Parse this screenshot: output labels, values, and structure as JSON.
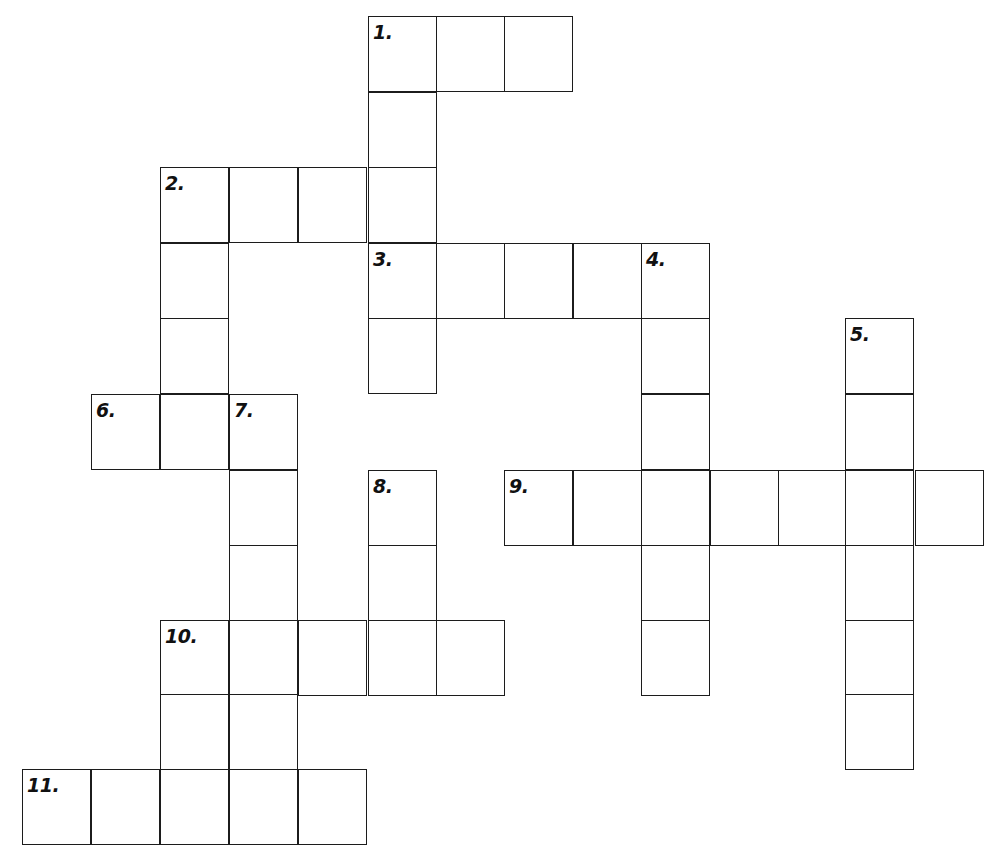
{
  "puzzle": {
    "kind": "crossword-grid",
    "title": "",
    "canvas": {
      "width": 998,
      "height": 865
    },
    "geometry": {
      "col_x": [
        22,
        91,
        160,
        229,
        298,
        368,
        436,
        504,
        573,
        641,
        710,
        778,
        845,
        915
      ],
      "row_y": [
        16,
        92,
        167,
        243,
        318,
        394,
        470,
        545,
        620,
        694,
        769
      ],
      "cell_w": 69,
      "cell_h": 76,
      "line_color": "#1c1c1c",
      "cell_fill": "#ffffff",
      "number_color": "#111111"
    },
    "entries": [
      {
        "number": "1.",
        "direction": "across",
        "start": {
          "col": 5,
          "row": 0
        },
        "length": 3
      },
      {
        "number": "1d",
        "direction": "down",
        "start": {
          "col": 5,
          "row": 0
        },
        "length": 4
      },
      {
        "number": "2.",
        "direction": "across",
        "start": {
          "col": 2,
          "row": 2
        },
        "length": 4
      },
      {
        "number": "2d",
        "direction": "down",
        "start": {
          "col": 2,
          "row": 2
        },
        "length": 4
      },
      {
        "number": "3.",
        "direction": "across",
        "start": {
          "col": 5,
          "row": 3
        },
        "length": 5
      },
      {
        "number": "3d",
        "direction": "down",
        "start": {
          "col": 5,
          "row": 3
        },
        "length": 2
      },
      {
        "number": "4.",
        "direction": "down",
        "start": {
          "col": 9,
          "row": 3
        },
        "length": 7
      },
      {
        "number": "5.",
        "direction": "down",
        "start": {
          "col": 12,
          "row": 4
        },
        "length": 6
      },
      {
        "number": "6.",
        "direction": "across",
        "start": {
          "col": 1,
          "row": 5
        },
        "length": 3
      },
      {
        "number": "7.",
        "direction": "down",
        "start": {
          "col": 3,
          "row": 5
        },
        "length": 6
      },
      {
        "number": "8.",
        "direction": "down",
        "start": {
          "col": 5,
          "row": 6
        },
        "length": 3
      },
      {
        "number": "9.",
        "direction": "across",
        "start": {
          "col": 7,
          "row": 6
        },
        "length": 7
      },
      {
        "number": "10.",
        "direction": "across",
        "start": {
          "col": 2,
          "row": 8
        },
        "length": 5
      },
      {
        "number": "10d",
        "direction": "down",
        "start": {
          "col": 2,
          "row": 8
        },
        "length": 3
      },
      {
        "number": "11.",
        "direction": "across",
        "start": {
          "col": 0,
          "row": 10
        },
        "length": 5
      }
    ],
    "cells": [
      {
        "col": 5,
        "row": 0
      },
      {
        "col": 6,
        "row": 0
      },
      {
        "col": 7,
        "row": 0
      },
      {
        "col": 5,
        "row": 1
      },
      {
        "col": 2,
        "row": 2
      },
      {
        "col": 3,
        "row": 2
      },
      {
        "col": 4,
        "row": 2
      },
      {
        "col": 5,
        "row": 2
      },
      {
        "col": 2,
        "row": 3
      },
      {
        "col": 5,
        "row": 3
      },
      {
        "col": 6,
        "row": 3
      },
      {
        "col": 7,
        "row": 3
      },
      {
        "col": 8,
        "row": 3
      },
      {
        "col": 9,
        "row": 3
      },
      {
        "col": 2,
        "row": 4
      },
      {
        "col": 5,
        "row": 4
      },
      {
        "col": 9,
        "row": 4
      },
      {
        "col": 12,
        "row": 4
      },
      {
        "col": 1,
        "row": 5
      },
      {
        "col": 2,
        "row": 5
      },
      {
        "col": 3,
        "row": 5
      },
      {
        "col": 9,
        "row": 5
      },
      {
        "col": 12,
        "row": 5
      },
      {
        "col": 3,
        "row": 6
      },
      {
        "col": 5,
        "row": 6
      },
      {
        "col": 7,
        "row": 6
      },
      {
        "col": 8,
        "row": 6
      },
      {
        "col": 9,
        "row": 6
      },
      {
        "col": 10,
        "row": 6
      },
      {
        "col": 11,
        "row": 6
      },
      {
        "col": 12,
        "row": 6
      },
      {
        "col": 13,
        "row": 6
      },
      {
        "col": 3,
        "row": 7
      },
      {
        "col": 5,
        "row": 7
      },
      {
        "col": 9,
        "row": 7
      },
      {
        "col": 12,
        "row": 7
      },
      {
        "col": 2,
        "row": 8
      },
      {
        "col": 3,
        "row": 8
      },
      {
        "col": 4,
        "row": 8
      },
      {
        "col": 5,
        "row": 8
      },
      {
        "col": 6,
        "row": 8
      },
      {
        "col": 9,
        "row": 8
      },
      {
        "col": 12,
        "row": 8
      },
      {
        "col": 2,
        "row": 9
      },
      {
        "col": 3,
        "row": 9
      },
      {
        "col": 12,
        "row": 9
      },
      {
        "col": 0,
        "row": 10
      },
      {
        "col": 1,
        "row": 10
      },
      {
        "col": 2,
        "row": 10
      },
      {
        "col": 3,
        "row": 10
      },
      {
        "col": 4,
        "row": 10
      }
    ],
    "numbers": [
      {
        "label": "1.",
        "col": 5,
        "row": 0
      },
      {
        "label": "2.",
        "col": 2,
        "row": 2
      },
      {
        "label": "3.",
        "col": 5,
        "row": 3
      },
      {
        "label": "4.",
        "col": 9,
        "row": 3
      },
      {
        "label": "5.",
        "col": 12,
        "row": 4
      },
      {
        "label": "6.",
        "col": 1,
        "row": 5
      },
      {
        "label": "7.",
        "col": 3,
        "row": 5
      },
      {
        "label": "8.",
        "col": 5,
        "row": 6
      },
      {
        "label": "9.",
        "col": 7,
        "row": 6
      },
      {
        "label": "10.",
        "col": 2,
        "row": 8
      },
      {
        "label": "11.",
        "col": 0,
        "row": 10
      }
    ]
  }
}
